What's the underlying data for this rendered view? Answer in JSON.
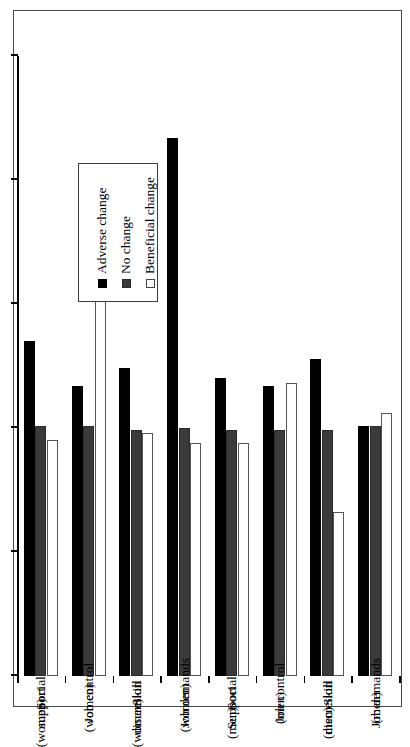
{
  "chart_data": {
    "type": "bar",
    "orientation": "horizontal-rotated",
    "title": "",
    "xlabel": "",
    "ylabel": "Odds Ratios",
    "ylim": [
      0,
      2.5
    ],
    "yticks": [
      "0",
      "0.5",
      "1",
      "1.5",
      "2",
      "2.5"
    ],
    "ytick_values": [
      0,
      0.5,
      1,
      1.5,
      2,
      2.5
    ],
    "grid": false,
    "legend_position": "upper-left",
    "categories": [
      "Social support (women)",
      "Job control (women)",
      "Skill discretion (women)",
      "Job demands (women)",
      "Social Support (men)",
      "Job control (men)",
      "Skill discretion (men)",
      "Job demands (men)"
    ],
    "category_lines": [
      [
        "Social",
        "support",
        "(women)"
      ],
      [
        "Job control",
        "(women)"
      ],
      [
        "Skill",
        "discretion",
        "(women)"
      ],
      [
        "Job demands",
        "(women)"
      ],
      [
        "Social",
        "Support",
        "(men)"
      ],
      [
        "Job control",
        "(men)"
      ],
      [
        "Skill",
        "discretion",
        "(men)"
      ],
      [
        "Job demands",
        "(men)"
      ]
    ],
    "series": [
      {
        "name": "Adverse change",
        "color": "#000000",
        "values": [
          1.35,
          1.17,
          1.24,
          2.17,
          1.2,
          1.17,
          1.28,
          1.01
        ]
      },
      {
        "name": "No change",
        "color": "#3a3a3a",
        "values": [
          1.01,
          1.01,
          0.99,
          1.0,
          0.99,
          0.99,
          0.99,
          1.01
        ]
      },
      {
        "name": "Beneficial change",
        "color": "#ffffff",
        "values": [
          0.95,
          1.76,
          0.98,
          0.94,
          0.94,
          1.18,
          0.66,
          1.06
        ]
      }
    ]
  },
  "legend": {
    "items": [
      {
        "label": "Adverse change",
        "swatch": "adverse"
      },
      {
        "label": "No change",
        "swatch": "nochange"
      },
      {
        "label": "Beneficial change",
        "swatch": "beneficial"
      }
    ]
  },
  "axis": {
    "value_axis_title": "Odds Ratios"
  }
}
